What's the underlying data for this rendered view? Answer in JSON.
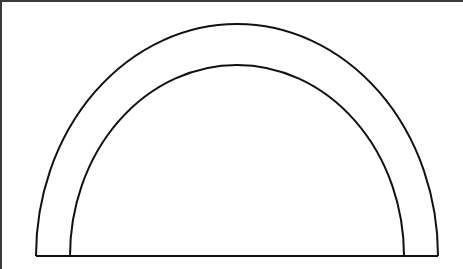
{
  "diagram": {
    "shape": "semi-elliptical arch",
    "stroke_color": "#111111",
    "fill_color": "#ffffff",
    "border_color": "#3a3a3a",
    "outer_arc": {
      "cx": 235,
      "base_y": 254,
      "rx": 201,
      "ry": 232
    },
    "inner_arc": {
      "cx": 235,
      "base_y": 254,
      "rx": 167,
      "ry": 191
    }
  }
}
